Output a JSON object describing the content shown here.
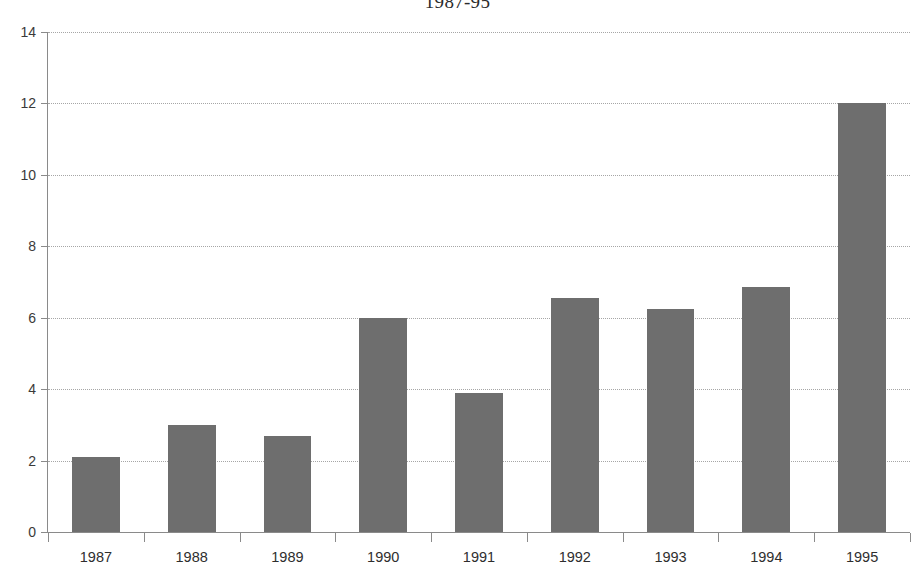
{
  "chart_data": {
    "type": "bar",
    "title": "1987-95",
    "xlabel": "",
    "ylabel": "",
    "categories": [
      "1987",
      "1988",
      "1989",
      "1990",
      "1991",
      "1992",
      "1993",
      "1994",
      "1995"
    ],
    "values": [
      2.1,
      3.0,
      2.7,
      6.0,
      3.9,
      6.55,
      6.25,
      6.85,
      12.0
    ],
    "series": [
      {
        "name": "",
        "values": [
          2.1,
          3.0,
          2.7,
          6.0,
          3.9,
          6.55,
          6.25,
          6.85,
          12.0
        ]
      }
    ],
    "ylim": [
      0,
      14
    ],
    "ytick_labels": [
      "0",
      "2",
      "4",
      "6",
      "8",
      "10",
      "12",
      "14"
    ],
    "ytick_values": [
      0,
      2,
      4,
      6,
      8,
      10,
      12,
      14
    ],
    "grid": true,
    "grid_axis": "y",
    "legend": false,
    "legend_position": "none",
    "bar_color": "#6e6e6e",
    "axis_color": "#8a8a8a",
    "gridline_color": "#a6a6a6",
    "text_color": "#2e2e2e",
    "background": "#ffffff"
  }
}
